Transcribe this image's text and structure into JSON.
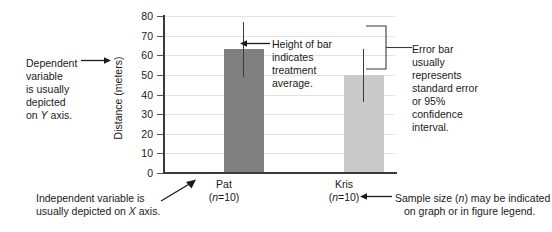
{
  "chart_data": {
    "type": "bar",
    "title": "",
    "xlabel": "",
    "ylabel": "Distance (meters)",
    "ylim": [
      0,
      80
    ],
    "yticks": [
      0,
      10,
      20,
      30,
      40,
      50,
      60,
      70,
      80
    ],
    "ytick_labels": [
      "0",
      "10",
      "20",
      "30",
      "40",
      "50",
      "60",
      "70",
      "80"
    ],
    "grid": true,
    "grid_axis": "y",
    "legend": "none",
    "categories": [
      "Pat",
      "Kris"
    ],
    "sample_sizes": [
      "(n=10)",
      "(n=10)"
    ],
    "values": [
      63,
      50
    ],
    "errors_low": [
      49,
      36
    ],
    "errors_high": [
      77,
      63
    ],
    "bar_colors": [
      "#808080",
      "#c9c9c9"
    ],
    "series": [
      {
        "name": "Distance",
        "values": [
          63,
          50
        ],
        "err_low": [
          49,
          36
        ],
        "err_high": [
          77,
          63
        ]
      }
    ]
  },
  "axes": {
    "y_title": "Distance (meters)",
    "y_tick_labels": [
      "80",
      "70",
      "60",
      "50",
      "40",
      "30",
      "20",
      "10",
      "0"
    ]
  },
  "categories": [
    {
      "name": "Pat",
      "n_label": "(n=10)",
      "n_prefix": "(",
      "n_italic": "n",
      "n_suffix": "=10)"
    },
    {
      "name": "Kris",
      "n_label": "(n=10)",
      "n_prefix": "(",
      "n_italic": "n",
      "n_suffix": "=10)"
    }
  ],
  "annotations": {
    "dependent": {
      "line1": "Dependent",
      "line2": "variable",
      "line3": "is usually",
      "line4": "depicted",
      "line5_pre": "on ",
      "line5_italic": "Y",
      "line5_post": " axis."
    },
    "bar_height": {
      "line1": "Height of bar",
      "line2": "indicates",
      "line3": "treatment",
      "line4": "average."
    },
    "error_bar": {
      "line1": "Error bar",
      "line2": "usually",
      "line3": "represents",
      "line4": "standard error",
      "line5": "or 95%",
      "line6": "confidence",
      "line7": "interval."
    },
    "independent": {
      "line1": "Independent variable is",
      "line2_pre": "usually depicted on ",
      "line2_italic": "X",
      "line2_post": " axis."
    },
    "sample_size": {
      "line1_pre": "Sample size (",
      "line1_italic": "n",
      "line1_post": ") may be indicated",
      "line2": "on graph or in figure legend."
    }
  },
  "colors": {
    "bar_pat": "#808080",
    "bar_kris": "#c9c9c9",
    "axis": "#3a3a3a",
    "grid": "#e3e3e3",
    "text": "#1a1a1a"
  }
}
